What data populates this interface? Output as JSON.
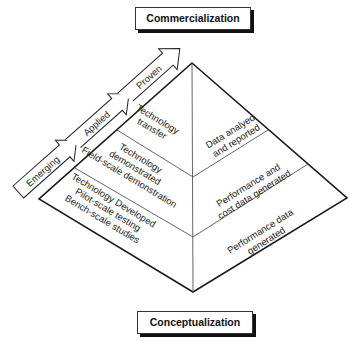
{
  "diagram": {
    "top_box": {
      "label": "Commercialization"
    },
    "bottom_box": {
      "label": "Conceptualization"
    },
    "arrows": [
      {
        "label": "Emerging"
      },
      {
        "label": "Applied"
      },
      {
        "label": "Proven"
      }
    ],
    "left_face": {
      "levels": [
        {
          "lines": [
            "Technology",
            "transfer"
          ]
        },
        {
          "lines": [
            "Technology",
            "demonstrated",
            "Field-scale demonstration"
          ]
        },
        {
          "lines": [
            "Technology Developed",
            "Pilot-scale testing",
            "Bench-scale studies"
          ]
        }
      ]
    },
    "right_face": {
      "levels": [
        {
          "lines": [
            "Data analyed",
            "and reported"
          ]
        },
        {
          "lines": [
            "Performance and",
            "cost data generated"
          ]
        },
        {
          "lines": [
            "Performance data",
            "generated"
          ]
        }
      ]
    },
    "colors": {
      "line": "#1a1a1a",
      "divider": "#555555",
      "background": "#ffffff"
    }
  }
}
